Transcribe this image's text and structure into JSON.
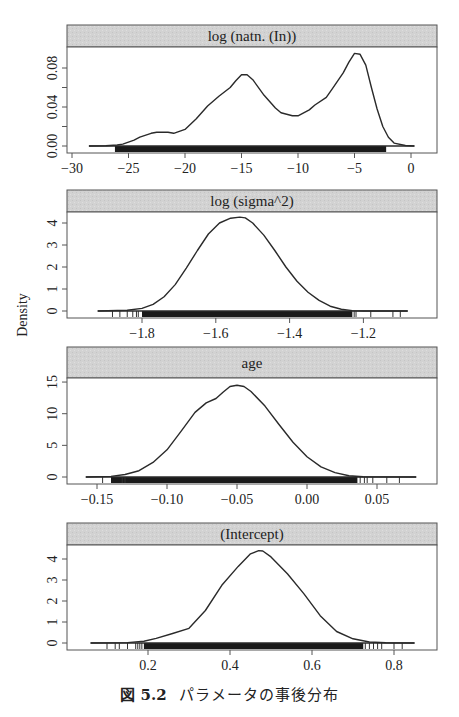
{
  "figure": {
    "caption_number": "図 5.2",
    "caption_text": "パラメータの事後分布",
    "ylabel": "Density",
    "colors": {
      "strip_bg": "#d4d4d4",
      "line": "#2a2a2a",
      "rug": "#1a1a1a",
      "frame": "#555555"
    }
  },
  "chart_data": [
    {
      "type": "line",
      "title": "log (natn. (In))",
      "xlabel": "",
      "ylabel": "Density",
      "xticks": [
        -30,
        -25,
        -20,
        -15,
        -10,
        -5,
        0
      ],
      "xtick_labels": [
        "−30",
        "−25",
        "−20",
        "−15",
        "−10",
        "−5",
        "0"
      ],
      "yticks": [
        0.0,
        0.02,
        0.04,
        0.06,
        0.08
      ],
      "ytick_labels": [
        "0.00",
        "",
        "0.04",
        "",
        "0.08"
      ],
      "x": [
        -28.5,
        -27,
        -26,
        -25.5,
        -24.5,
        -24,
        -23,
        -22.5,
        -21.5,
        -21,
        -20,
        -19,
        -18,
        -17,
        -16,
        -15.5,
        -15,
        -14.5,
        -14,
        -13,
        -12,
        -11.5,
        -10.5,
        -10,
        -9,
        -8.5,
        -7.5,
        -7,
        -6,
        -5.5,
        -5,
        -4.5,
        -4,
        -3.5,
        -3,
        -2.5,
        -2,
        -1.5,
        -0.5,
        0.3
      ],
      "y": [
        0,
        0.0003,
        0.001,
        0.002,
        0.006,
        0.009,
        0.013,
        0.014,
        0.014,
        0.013,
        0.017,
        0.028,
        0.041,
        0.051,
        0.06,
        0.067,
        0.073,
        0.073,
        0.068,
        0.052,
        0.039,
        0.034,
        0.031,
        0.031,
        0.037,
        0.042,
        0.05,
        0.058,
        0.075,
        0.086,
        0.095,
        0.094,
        0.083,
        0.06,
        0.038,
        0.02,
        0.009,
        0.003,
        0.0005,
        0
      ],
      "rug": {
        "solid_from": -26.2,
        "solid_to": -2.2,
        "isolated": []
      },
      "mapping": {
        "x0": 411,
        "xs": 11.3,
        "y0": 146,
        "ys": 975,
        "box": [
          67,
          25,
          437,
          47,
          153
        ]
      }
    },
    {
      "type": "line",
      "title": "log (sigma^2)",
      "xlabel": "",
      "ylabel": "Density",
      "xticks": [
        -1.8,
        -1.6,
        -1.4,
        -1.2
      ],
      "xtick_labels": [
        "−1.8",
        "−1.6",
        "−1.4",
        "−1.2"
      ],
      "yticks": [
        0,
        1,
        2,
        3,
        4
      ],
      "ytick_labels": [
        "0",
        "1",
        "2",
        "3",
        "4"
      ],
      "x": [
        -1.92,
        -1.84,
        -1.8,
        -1.77,
        -1.74,
        -1.71,
        -1.68,
        -1.65,
        -1.62,
        -1.59,
        -1.56,
        -1.535,
        -1.52,
        -1.5,
        -1.47,
        -1.44,
        -1.41,
        -1.38,
        -1.35,
        -1.32,
        -1.29,
        -1.26,
        -1.23,
        -1.2,
        -1.08
      ],
      "y": [
        0,
        0.03,
        0.12,
        0.3,
        0.65,
        1.2,
        1.95,
        2.75,
        3.5,
        4.0,
        4.22,
        4.27,
        4.23,
        4.0,
        3.45,
        2.75,
        2.0,
        1.35,
        0.85,
        0.48,
        0.22,
        0.08,
        0.02,
        0,
        0
      ],
      "rug": {
        "solid_from": -1.8,
        "solid_to": -1.23,
        "isolated": [
          -1.88,
          -1.86,
          -1.84,
          -1.825,
          -1.815,
          -1.81,
          -1.225,
          -1.22,
          -1.18,
          -1.12,
          -1.1
        ]
      },
      "mapping": {
        "x0": 142,
        "xs": 369,
        "xoff": 1.8,
        "y0": 311,
        "ys": 22,
        "box": [
          67,
          190,
          437,
          212,
          318
        ]
      }
    },
    {
      "type": "line",
      "title": "age",
      "xlabel": "",
      "ylabel": "Density",
      "xticks": [
        -0.15,
        -0.1,
        -0.05,
        0.0,
        0.05
      ],
      "xtick_labels": [
        "−0.15",
        "−0.10",
        "−0.05",
        "0.00",
        "0.05"
      ],
      "yticks": [
        0,
        5,
        10,
        15
      ],
      "ytick_labels": [
        "0",
        "5",
        "10",
        "15"
      ],
      "x": [
        -0.158,
        -0.14,
        -0.13,
        -0.12,
        -0.11,
        -0.1,
        -0.09,
        -0.08,
        -0.072,
        -0.065,
        -0.06,
        -0.055,
        -0.05,
        -0.045,
        -0.04,
        -0.03,
        -0.02,
        -0.01,
        0.0,
        0.01,
        0.02,
        0.03,
        0.04,
        0.078
      ],
      "y": [
        0,
        0.1,
        0.4,
        1.0,
        2.3,
        4.3,
        7.2,
        10.2,
        11.7,
        12.4,
        13.4,
        14.3,
        14.5,
        14.3,
        13.5,
        11.2,
        8.3,
        5.5,
        3.2,
        1.6,
        0.7,
        0.2,
        0.05,
        0
      ],
      "rug": {
        "solid_from": -0.14,
        "solid_to": 0.036,
        "isolated": [
          -0.146,
          -0.132,
          -0.13,
          0.038,
          0.041,
          0.043,
          0.047,
          0.057,
          0.066
        ]
      },
      "mapping": {
        "x0": 307,
        "xs": 1400,
        "y0": 477,
        "ys": 6.33,
        "box": [
          67,
          347,
          437,
          378,
          484
        ]
      }
    },
    {
      "type": "line",
      "title": "(Intercept)",
      "xlabel": "",
      "ylabel": "Density",
      "xticks": [
        0.2,
        0.4,
        0.6,
        0.8
      ],
      "xtick_labels": [
        "0.2",
        "0.4",
        "0.6",
        "0.8"
      ],
      "yticks": [
        0,
        1,
        2,
        3,
        4
      ],
      "ytick_labels": [
        "0",
        "1",
        "2",
        "3",
        "4"
      ],
      "x": [
        0.06,
        0.15,
        0.19,
        0.22,
        0.26,
        0.3,
        0.34,
        0.38,
        0.42,
        0.45,
        0.47,
        0.48,
        0.5,
        0.54,
        0.58,
        0.62,
        0.66,
        0.7,
        0.74,
        0.78,
        0.85
      ],
      "y": [
        0,
        0.02,
        0.08,
        0.22,
        0.45,
        0.7,
        1.55,
        2.75,
        3.65,
        4.25,
        4.4,
        4.38,
        4.1,
        3.3,
        2.35,
        1.3,
        0.55,
        0.2,
        0.05,
        0.01,
        0
      ],
      "rug": {
        "solid_from": 0.19,
        "solid_to": 0.725,
        "isolated": [
          0.1,
          0.12,
          0.13,
          0.15,
          0.17,
          0.175,
          0.18,
          0.185,
          0.73,
          0.74,
          0.75,
          0.76,
          0.77,
          0.8,
          0.82
        ]
      },
      "mapping": {
        "x0": 148,
        "xs": 410,
        "xoff": -0.2,
        "y0": 643,
        "ys": 21,
        "box": [
          67,
          523,
          437,
          545,
          650
        ]
      }
    }
  ]
}
